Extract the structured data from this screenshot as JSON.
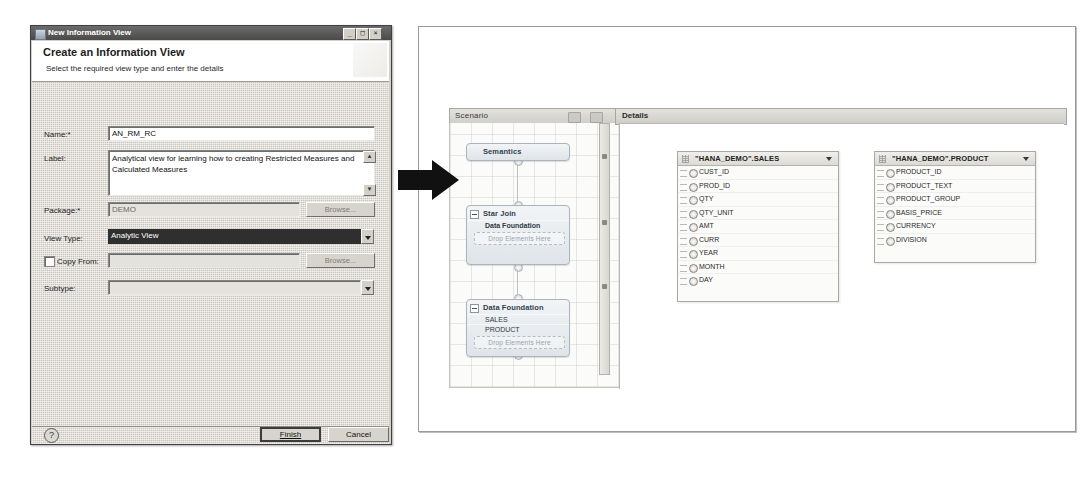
{
  "dialog": {
    "titlebar": {
      "title": "New Information View",
      "window_icon": "window-icon",
      "minimize": "_",
      "maximize": "□",
      "close": "×"
    },
    "banner": {
      "heading": "Create an Information View",
      "subheading": "Select the required view type and enter the details"
    },
    "fields": {
      "name": {
        "label": "Name:*",
        "value": "AN_RM_RC",
        "placeholder": ""
      },
      "label": {
        "label": "Label:",
        "value": "Analytical view for learning  how to creating Restricted Measures and Calculated Measures",
        "scroll_up": "▲",
        "scroll_down": "▼"
      },
      "package": {
        "label": "Package:*",
        "value": "DEMO",
        "button": "Browse..."
      },
      "view_type": {
        "label": "View Type:",
        "value": "Analytic View",
        "options": [
          "Attribute View",
          "Analytic View",
          "Calculation View"
        ]
      },
      "copy_from": {
        "label": "Copy From:",
        "checked": false,
        "value": "",
        "button": "Browse..."
      },
      "subtype": {
        "label": "Subtype:",
        "value": "",
        "options": []
      }
    },
    "footer": {
      "help": "?",
      "finish": "Finish",
      "cancel": "Cancel"
    }
  },
  "arrow": {
    "name": "right-arrow",
    "color": "#111111"
  },
  "workbench": {
    "scenario": {
      "title": "Scenario",
      "toolbar_icons": [
        "auto-layout-icon",
        "zoom-fit-icon"
      ],
      "nodes": [
        {
          "name": "Semantics",
          "type": "semantics",
          "rows": [],
          "dropzone": ""
        },
        {
          "name": "Star Join",
          "type": "star-join",
          "rows": [
            {
              "label": "Data Foundation",
              "icon": "data-foundation-icon"
            }
          ],
          "dropzone": "Drop Elements Here"
        },
        {
          "name": "Data Foundation",
          "type": "data-foundation",
          "rows": [
            {
              "label": "SALES",
              "icon": "table-icon"
            },
            {
              "label": "PRODUCT",
              "icon": "table-icon"
            }
          ],
          "dropzone": "Drop Elements Here"
        }
      ]
    },
    "details": {
      "title": "Details",
      "tables": [
        {
          "name": "\"HANA_DEMO\".SALES",
          "columns": [
            "CUST_ID",
            "PROD_ID",
            "QTY",
            "QTY_UNIT",
            "AMT",
            "CURR",
            "YEAR",
            "MONTH",
            "DAY"
          ]
        },
        {
          "name": "\"HANA_DEMO\".PRODUCT",
          "columns": [
            "PRODUCT_ID",
            "PRODUCT_TEXT",
            "PRODUCT_GROUP",
            "BASIS_PRICE",
            "CURRENCY",
            "DIVISION"
          ]
        }
      ]
    }
  }
}
